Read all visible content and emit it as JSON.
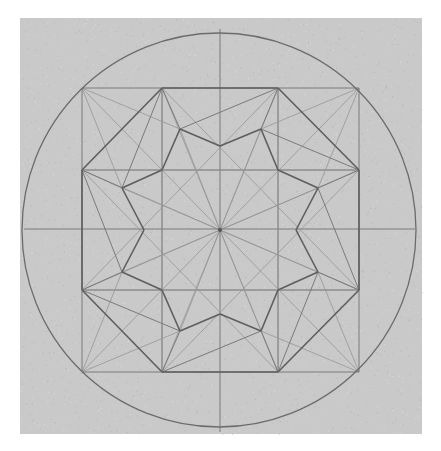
{
  "figure": {
    "paper": {
      "x": 20,
      "y": 18,
      "width": 402,
      "height": 416,
      "color": "#c9c9c9"
    },
    "line_color": "#6c6c6c",
    "circle": {
      "cx": 219,
      "cy": 230,
      "r": 197
    },
    "axes": [
      {
        "x1": 220,
        "y1": 29,
        "x2": 220,
        "y2": 432
      },
      {
        "x1": 24,
        "y1": 229,
        "x2": 415,
        "y2": 229
      }
    ],
    "square": {
      "x": 82,
      "y": 88,
      "width": 277,
      "height": 284
    },
    "grid_lines": [
      {
        "x1": 162,
        "y1": 88,
        "x2": 162,
        "y2": 372
      },
      {
        "x1": 278,
        "y1": 88,
        "x2": 278,
        "y2": 372
      },
      {
        "x1": 82,
        "y1": 170,
        "x2": 359,
        "y2": 170
      },
      {
        "x1": 82,
        "y1": 290,
        "x2": 359,
        "y2": 290
      }
    ],
    "octagon": [
      [
        162,
        88
      ],
      [
        278,
        88
      ],
      [
        359,
        170
      ],
      [
        359,
        290
      ],
      [
        278,
        372
      ],
      [
        162,
        372
      ],
      [
        82,
        290
      ],
      [
        82,
        170
      ]
    ],
    "inner_star": [
      [
        220,
        146
      ],
      [
        261,
        129
      ],
      [
        278,
        170
      ],
      [
        318,
        188
      ],
      [
        296,
        230
      ],
      [
        318,
        272
      ],
      [
        278,
        290
      ],
      [
        261,
        331
      ],
      [
        220,
        314
      ],
      [
        180,
        331
      ],
      [
        162,
        290
      ],
      [
        122,
        272
      ],
      [
        144,
        230
      ],
      [
        122,
        188
      ],
      [
        162,
        170
      ],
      [
        180,
        129
      ]
    ],
    "outer_points": [
      [
        180,
        129
      ],
      [
        261,
        129
      ],
      [
        318,
        188
      ],
      [
        318,
        272
      ],
      [
        261,
        331
      ],
      [
        180,
        331
      ],
      [
        122,
        272
      ],
      [
        122,
        188
      ]
    ],
    "center": [
      220,
      230
    ]
  }
}
